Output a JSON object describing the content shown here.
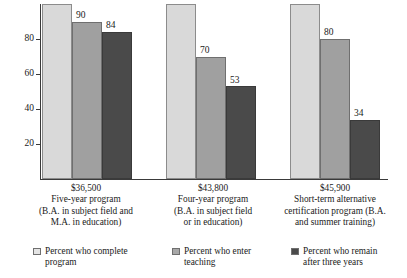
{
  "chart_data": {
    "type": "bar",
    "title": "",
    "subtitle": "",
    "xlabel": "",
    "ylabel": "",
    "ylim": [
      0,
      100
    ],
    "yticks": [
      20,
      40,
      60,
      80
    ],
    "grid": false,
    "legend_position": "bottom",
    "categories": [
      "Five-year program (B.A. in subject field and M.A. in education)",
      "Four-year program (B.A. in subject field or in education)",
      "Short-term alternative certification program (B.A. and summer training)"
    ],
    "category_blocks": [
      {
        "cost": "$36,500",
        "lines": [
          "Five-year program",
          "(B.A. in subject field and",
          "M.A. in education)"
        ]
      },
      {
        "cost": "$43,800",
        "lines": [
          "Four-year program",
          "(B.A. in subject field",
          "or in education)"
        ]
      },
      {
        "cost": "$45,900",
        "lines": [
          "Short-term alternative",
          "certification program (B.A.",
          "and summer training)"
        ]
      }
    ],
    "series": [
      {
        "name": "Percent who complete program",
        "legend_lines": [
          "Percent who complete",
          "program"
        ],
        "color": "#d9d9d9",
        "values": [
          100,
          100,
          100
        ],
        "show_labels": false
      },
      {
        "name": "Percent who enter teaching",
        "legend_lines": [
          "Percent who enter",
          "teaching"
        ],
        "color": "#a0a0a0",
        "values": [
          90,
          70,
          80
        ],
        "show_labels": true
      },
      {
        "name": "Percent who remain after three years",
        "legend_lines": [
          "Percent who remain",
          "after three years"
        ],
        "color": "#4a4a4a",
        "values": [
          84,
          53,
          34
        ],
        "show_labels": true
      }
    ]
  },
  "axis": {
    "tick_20": "20",
    "tick_40": "40",
    "tick_60": "60",
    "tick_80": "80"
  },
  "labels": {
    "g0_s1": "90",
    "g0_s2": "84",
    "g1_s1": "70",
    "g1_s2": "53",
    "g2_s1": "80",
    "g2_s2": "34"
  },
  "categories": {
    "g0_cost": "$36,500",
    "g0_l0": "Five-year program",
    "g0_l1": "(B.A. in subject field and",
    "g0_l2": "M.A. in education)",
    "g1_cost": "$43,800",
    "g1_l0": "Four-year program",
    "g1_l1": "(B.A. in subject field",
    "g1_l2": "or in education)",
    "g2_cost": "$45,900",
    "g2_l0": "Short-term alternative",
    "g2_l1": "certification program (B.A.",
    "g2_l2": "and summer training)"
  },
  "legend": {
    "i0_l0": "Percent who complete",
    "i0_l1": "program",
    "i1_l0": "Percent who enter",
    "i1_l1": "teaching",
    "i2_l0": "Percent who remain",
    "i2_l1": "after three years"
  }
}
